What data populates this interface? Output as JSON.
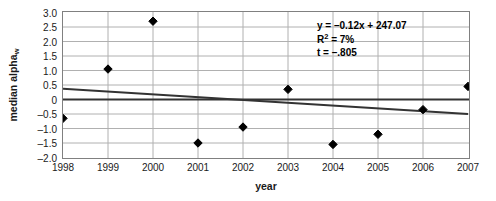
{
  "chart_data": {
    "type": "scatter",
    "title": "",
    "xlabel": "year",
    "ylabel": "median alpha",
    "ylabel_subscript": "w",
    "categories": [
      1998,
      1999,
      2000,
      2001,
      2002,
      2003,
      2004,
      2005,
      2006,
      2007
    ],
    "x_tick_labels": [
      "1998",
      "1999",
      "2000",
      "2001",
      "2002",
      "2003",
      "2004",
      "2005",
      "2006",
      "2007"
    ],
    "values": [
      -0.65,
      1.05,
      2.7,
      -1.5,
      -0.95,
      0.35,
      -1.55,
      -1.2,
      -0.35,
      0.45
    ],
    "series": [
      {
        "name": "median alpha_w",
        "marker": "diamond",
        "marker_color": "#000000",
        "values": [
          -0.65,
          1.05,
          2.7,
          -1.5,
          -0.95,
          0.35,
          -1.55,
          -1.2,
          -0.35,
          0.45
        ]
      }
    ],
    "trendline": {
      "name": "linear trendline",
      "color": "#333333",
      "start": {
        "x": 1998,
        "y": 0.37
      },
      "end": {
        "x": 2007,
        "y": -0.5
      }
    },
    "zero_line": {
      "name": "zero reference line",
      "y": 0,
      "color": "#333333"
    },
    "ylim": [
      -2.0,
      3.0
    ],
    "y_tick_values": [
      3.0,
      2.5,
      2.0,
      1.5,
      1.0,
      0.5,
      0,
      -0.5,
      -1.0,
      -1.5,
      -2.0
    ],
    "y_tick_labels": [
      "3.0",
      "2.5",
      "2.0",
      "1.5",
      "1.0",
      "0.5",
      "0",
      "–0.5",
      "–1.0",
      "–1.5",
      "–2.0"
    ],
    "grid": {
      "horizontal": true,
      "vertical": true,
      "color": "#b0b0b0"
    },
    "legend_position": "none",
    "plot_background": "#ffffff",
    "annotations": {
      "equation": "y = –0.12x + 247.07",
      "r_squared_prefix": "R",
      "r_squared_exponent": "2",
      "r_squared_value": " = 7%",
      "t_statistic": "t = –.805"
    }
  }
}
